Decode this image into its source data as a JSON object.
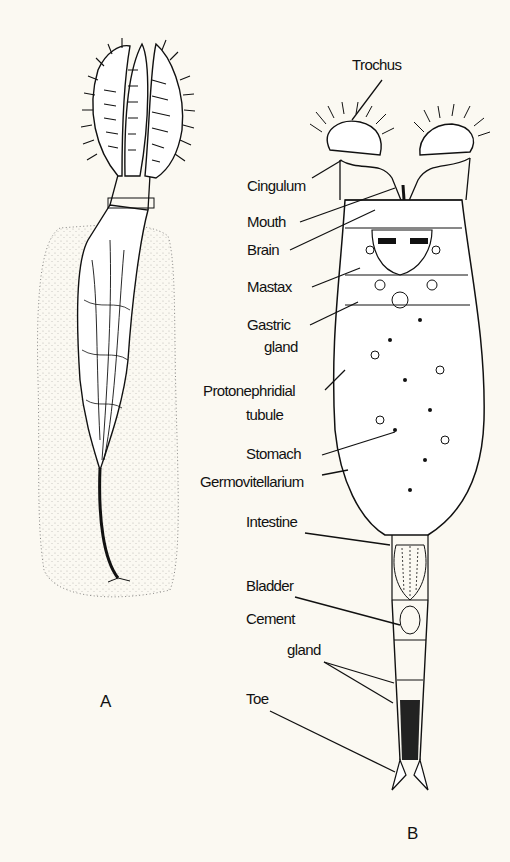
{
  "figure": {
    "background": "#fbf9f2",
    "ink": "#111111",
    "panels": [
      {
        "id": "A",
        "label": "A",
        "description": "Sessile rotifer with corona lobes extended, attached within gelatinous tube"
      },
      {
        "id": "B",
        "label": "B",
        "description": "Anatomy of a generalized rotifer"
      }
    ],
    "labels": [
      {
        "text": "Trochus"
      },
      {
        "text": "Cingulum"
      },
      {
        "text": "Mouth"
      },
      {
        "text": "Brain"
      },
      {
        "text": "Mastax"
      },
      {
        "text": "Gastric"
      },
      {
        "text": "gland"
      },
      {
        "text": "Protonephridial"
      },
      {
        "text": "tubule"
      },
      {
        "text": "Stomach"
      },
      {
        "text": "Germovitellarium"
      },
      {
        "text": "Intestine"
      },
      {
        "text": "Bladder"
      },
      {
        "text": "Cement"
      },
      {
        "text": "gland"
      },
      {
        "text": "Toe"
      }
    ]
  }
}
